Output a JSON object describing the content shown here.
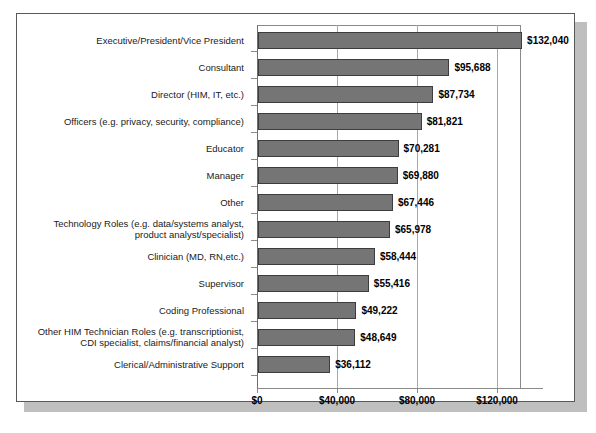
{
  "chart_data": {
    "type": "bar",
    "orientation": "horizontal",
    "title": "",
    "xlabel": "",
    "ylabel": "",
    "xlim": [
      0,
      132000
    ],
    "axis_max_display": 140000,
    "grid": true,
    "gridlines": [
      40000,
      80000,
      120000
    ],
    "legend": "none",
    "xtick_labels": [
      "$0",
      "$40,000",
      "$80,000",
      "$120,000"
    ],
    "xtick_values": [
      0,
      40000,
      80000,
      120000
    ],
    "categories": [
      "Executive/President/Vice President",
      "Consultant",
      "Director (HIM, IT, etc.)",
      "Officers (e.g. privacy, security, compliance)",
      "Educator",
      "Manager",
      "Other",
      "Technology Roles (e.g. data/systems analyst,\nproduct analyst/specialist)",
      "Clinician (MD, RN,etc.)",
      "Supervisor",
      "Coding Professional",
      "Other HIM Technician Roles (e.g. transcriptionist,\nCDI specialist, claims/financial analyst)",
      "Clerical/Administrative Support"
    ],
    "values": [
      132040,
      95688,
      87734,
      81821,
      70281,
      69880,
      67446,
      65978,
      58444,
      55416,
      49222,
      48649,
      36112
    ],
    "value_labels": [
      "$132,040",
      "$95,688",
      "$87,734",
      "$81,821",
      "$70,281",
      "$69,880",
      "$67,446",
      "$65,978",
      "$58,444",
      "$55,416",
      "$49,222",
      "$48,649",
      "$36,112"
    ],
    "bar_color": "#757575",
    "bar_border_color": "#3d3d3d",
    "background_color": "#ffffff",
    "frame_color": "#58595b"
  }
}
